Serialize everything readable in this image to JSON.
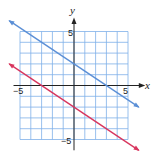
{
  "chart_data": {
    "type": "line",
    "title": "",
    "xlabel": "x",
    "ylabel": "y",
    "xlim": [
      -5,
      5
    ],
    "ylim": [
      -5,
      5
    ],
    "grid": true,
    "tick_labels": {
      "x": [
        "-5",
        "5"
      ],
      "y": [
        "5",
        "-5"
      ]
    },
    "series": [
      {
        "name": "blue line",
        "color": "#5b8fd6",
        "equation": "y = -2/3 x + 2",
        "slope": -0.6667,
        "intercept": 2,
        "x_intercept": 3,
        "points": [
          [
            -6,
            6
          ],
          [
            6,
            -2
          ]
        ]
      },
      {
        "name": "red line",
        "color": "#d8365e",
        "equation": "y = -2/3 x - 2",
        "slope": -0.6667,
        "intercept": -2,
        "x_intercept": -3,
        "points": [
          [
            -6,
            2
          ],
          [
            6,
            -6
          ]
        ]
      }
    ]
  },
  "axes": {
    "x_label": "x",
    "y_label": "y",
    "x_min_label": "−5",
    "x_max_label": "5",
    "y_max_label": "5",
    "y_min_label": "−5"
  },
  "colors": {
    "grid": "#7fb0e8",
    "axis": "#222222",
    "blue": "#5b8fd6",
    "red": "#d8365e"
  }
}
